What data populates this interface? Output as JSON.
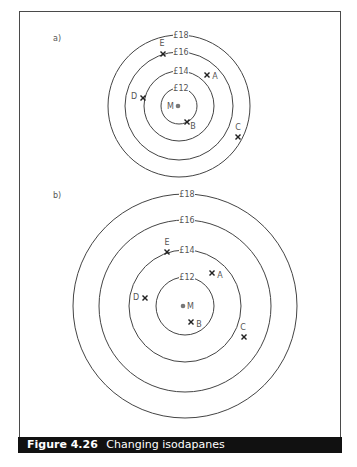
{
  "figure": {
    "number": "Figure 4.26",
    "title": "Changing isodapanes",
    "colors": {
      "frame": "#4a4a4a",
      "ring": "#444444",
      "label": "#555555",
      "cross": "#222222",
      "market_dot": "#777777",
      "caption_bg": "#111111",
      "caption_text": "#ffffff"
    }
  },
  "panels": [
    {
      "id": "a",
      "label": "a)",
      "label_pos": [
        53,
        41
      ],
      "center": [
        179,
        106
      ],
      "rings": [
        {
          "label": "£12",
          "radius": 18
        },
        {
          "label": "£14",
          "radius": 35
        },
        {
          "label": "£16",
          "radius": 54
        },
        {
          "label": "£18",
          "radius": 71
        }
      ],
      "market": {
        "label": "M",
        "pos": [
          178,
          106
        ],
        "label_side": "left"
      },
      "sites": [
        {
          "label": "A",
          "cross": [
            207,
            75
          ],
          "label_pos": [
            215,
            79
          ]
        },
        {
          "label": "B",
          "cross": [
            187,
            122
          ],
          "label_pos": [
            193,
            129
          ]
        },
        {
          "label": "C",
          "cross": [
            238,
            137
          ],
          "label_pos": [
            238,
            130
          ]
        },
        {
          "label": "D",
          "cross": [
            143,
            98
          ],
          "label_pos": [
            134,
            99
          ]
        },
        {
          "label": "E",
          "cross": [
            163,
            54
          ],
          "label_pos": [
            162,
            46
          ]
        }
      ]
    },
    {
      "id": "b",
      "label": "b)",
      "label_pos": [
        53,
        198
      ],
      "center": [
        185,
        306
      ],
      "rings": [
        {
          "label": "£12",
          "radius": 29
        },
        {
          "label": "£14",
          "radius": 56
        },
        {
          "label": "£16",
          "radius": 86
        },
        {
          "label": "£18",
          "radius": 112
        }
      ],
      "market": {
        "label": "M",
        "pos": [
          183,
          306
        ],
        "label_side": "right"
      },
      "sites": [
        {
          "label": "A",
          "cross": [
            212,
            273
          ],
          "label_pos": [
            220,
            278
          ]
        },
        {
          "label": "B",
          "cross": [
            191,
            322
          ],
          "label_pos": [
            199,
            327
          ]
        },
        {
          "label": "C",
          "cross": [
            244,
            337
          ],
          "label_pos": [
            243,
            330
          ]
        },
        {
          "label": "D",
          "cross": [
            145,
            298
          ],
          "label_pos": [
            136,
            300
          ]
        },
        {
          "label": "E",
          "cross": [
            167,
            252
          ],
          "label_pos": [
            167,
            245
          ]
        }
      ]
    }
  ]
}
